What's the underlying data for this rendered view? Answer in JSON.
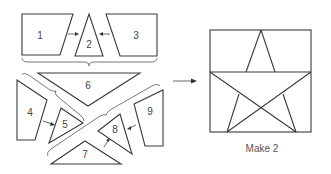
{
  "diagram": {
    "pieces": [
      {
        "id": "1",
        "label": "1"
      },
      {
        "id": "2",
        "label": "2"
      },
      {
        "id": "3",
        "label": "3"
      },
      {
        "id": "4",
        "label": "4"
      },
      {
        "id": "5",
        "label": "5"
      },
      {
        "id": "6",
        "label": "6"
      },
      {
        "id": "7",
        "label": "7"
      },
      {
        "id": "8",
        "label": "8"
      },
      {
        "id": "9",
        "label": "9"
      }
    ],
    "assembly_steps": [
      {
        "join": [
          "1",
          "2",
          "3"
        ],
        "result": "top row"
      },
      {
        "join": [
          "4",
          "5"
        ],
        "result": "left unit"
      },
      {
        "join": [
          "7",
          "8"
        ],
        "result": "right unit"
      },
      {
        "join": [
          "6",
          "left unit",
          "right unit",
          "9"
        ],
        "result": "bottom section"
      }
    ],
    "result": {
      "name": "finished-star-block",
      "caption": "Make 2"
    },
    "colors": {
      "stroke": "#3a3a3a",
      "label": "#444444",
      "background": "#ffffff"
    }
  }
}
